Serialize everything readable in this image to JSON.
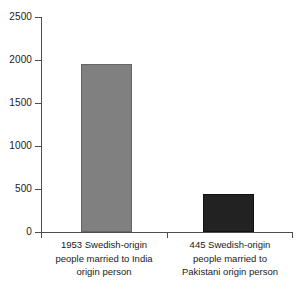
{
  "chart_data": {
    "type": "bar",
    "title": "",
    "subtitle": "",
    "xlabel": "",
    "ylabel": "",
    "ylim": [
      0,
      2500
    ],
    "ytick_values": [
      0,
      500,
      1000,
      1500,
      2000,
      2500
    ],
    "ytick_labels": [
      "0",
      "500",
      "1000",
      "1500",
      "2000",
      "2500"
    ],
    "grid": false,
    "legend": null,
    "categories": [
      "1953 Swedish-origin people married to India origin person",
      "445 Swedish-origin people married to Pakistani origin person"
    ],
    "category_label_lines": [
      [
        "1953 Swedish-origin",
        "people married to India",
        "origin person"
      ],
      [
        "445 Swedish-origin",
        "people married to",
        "Pakistani origin person"
      ]
    ],
    "values": [
      1953,
      445
    ],
    "bar_colors": [
      "#808080",
      "#222222"
    ],
    "bar_edge_colors": [
      "#666666",
      "#111111"
    ],
    "axis_color": "#4d4d4d",
    "background_color": "#ffffff"
  }
}
